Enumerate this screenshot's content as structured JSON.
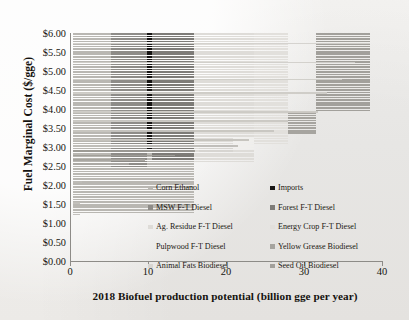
{
  "chart_data": {
    "type": "bar",
    "orientation": "horizontal-supply-curve",
    "title": "",
    "xlabel": "2018 Biofuel production potential (billion gge per year)",
    "ylabel": "Fuel Marginal Cost ($/gge)",
    "xlim": [
      0,
      40
    ],
    "ylim": [
      0,
      6
    ],
    "xticks": [
      "0",
      "10",
      "20",
      "30",
      "40"
    ],
    "xtick_values": [
      0,
      10,
      20,
      30,
      40
    ],
    "yticks": [
      "$0.00",
      "$0.50",
      "$1.00",
      "$1.50",
      "$2.00",
      "$2.50",
      "$3.00",
      "$3.50",
      "$4.00",
      "$4.50",
      "$5.00",
      "$5.50",
      "$6.00"
    ],
    "ytick_values": [
      0,
      0.5,
      1,
      1.5,
      2,
      2.5,
      3,
      3.5,
      4,
      4.5,
      5,
      5.5,
      6
    ],
    "grid": false,
    "legend_position": "inside-lower-center",
    "series": [
      {
        "name": "Corn Ethanol",
        "color": "#b9b7b2",
        "x_start": 0.35,
        "x_end": 15.9,
        "cost_low": 1.25,
        "cost_high": 6.0
      },
      {
        "name": "Imports",
        "color": "#171514",
        "x_start": 9.9,
        "x_end": 10.5,
        "cost_low": 2.95,
        "cost_high": 6.0
      },
      {
        "name": "MSW F-T Diesel",
        "color": "#8e8c88",
        "x_start": 5.2,
        "x_end": 9.9,
        "cost_low": 2.45,
        "cost_high": 6.0
      },
      {
        "name": "Forest F-T Diesel",
        "color": "#7e7c78",
        "x_start": 10.5,
        "x_end": 15.9,
        "cost_low": 2.7,
        "cost_high": 6.0
      },
      {
        "name": "Ag. Residue F-T Diesel",
        "color": "#dedcd8",
        "x_start": 15.9,
        "x_end": 23.6,
        "cost_low": 2.6,
        "cost_high": 6.0
      },
      {
        "name": "Energy Crop F-T Diesel",
        "color": "#e2e0dc",
        "x_start": 23.6,
        "x_end": 27.9,
        "cost_low": 3.05,
        "cost_high": 6.0
      },
      {
        "name": "Pulpwood F-T Diesel",
        "color": "#f0efec",
        "x_start": 20.9,
        "x_end": 23.6,
        "cost_low": 2.95,
        "cost_high": 3.25
      },
      {
        "name": "Yellow Grease Biodiesel",
        "color": "#a6a49f",
        "x_start": 27.9,
        "x_end": 31.6,
        "cost_low": 3.35,
        "cost_high": 3.95
      },
      {
        "name": "Animal Fats Biodiesel",
        "color": "#d7d5d1",
        "x_start": 16.6,
        "x_end": 20.9,
        "cost_low": 2.85,
        "cost_high": 3.05
      },
      {
        "name": "Seed Oil Biodiesel",
        "color": "#a2a09b",
        "x_start": 31.6,
        "x_end": 38.4,
        "cost_low": 3.95,
        "cost_high": 6.0
      }
    ],
    "steps": [
      {
        "x0": 0.35,
        "x1": 1.25,
        "y": 1.25,
        "color": "#c0beb9"
      },
      {
        "x0": 0.35,
        "x1": 1.3,
        "y": 1.55,
        "color": "#c0beb9"
      },
      {
        "x0": 0.35,
        "x1": 1.45,
        "y": 1.85,
        "color": "#bdbbb6"
      },
      {
        "x0": 0.35,
        "x1": 1.6,
        "y": 2.1,
        "color": "#bdbbb6"
      },
      {
        "x0": 0.35,
        "x1": 2.1,
        "y": 2.3,
        "color": "#bab8b3"
      },
      {
        "x0": 0.35,
        "x1": 4.3,
        "y": 2.45,
        "color": "#b7b5b0"
      },
      {
        "x0": 0.35,
        "x1": 7.6,
        "y": 2.58,
        "color": "#aaa8a3"
      },
      {
        "x0": 0.35,
        "x1": 9.6,
        "y": 2.68,
        "color": "#a4a29d"
      },
      {
        "x0": 0.35,
        "x1": 13.5,
        "y": 2.8,
        "color": "#a09e99"
      },
      {
        "x0": 0.35,
        "x1": 16.0,
        "y": 2.92,
        "color": "#9b9994"
      },
      {
        "x0": 0.35,
        "x1": 21.6,
        "y": 3.05,
        "color": "#bfbdb8"
      },
      {
        "x0": 0.35,
        "x1": 23.0,
        "y": 3.2,
        "color": "#c4c2bd"
      },
      {
        "x0": 0.35,
        "x1": 26.2,
        "y": 3.45,
        "color": "#c7c5c0"
      },
      {
        "x0": 0.35,
        "x1": 28.0,
        "y": 3.7,
        "color": "#c9c7c2"
      },
      {
        "x0": 0.35,
        "x1": 31.8,
        "y": 3.95,
        "color": "#cbc9c4"
      },
      {
        "x0": 0.35,
        "x1": 33.0,
        "y": 4.45,
        "color": "#cdcbc6"
      },
      {
        "x0": 0.35,
        "x1": 34.9,
        "y": 4.8,
        "color": "#cfcdc8"
      },
      {
        "x0": 0.35,
        "x1": 36.5,
        "y": 5.25,
        "color": "#d1cfca"
      },
      {
        "x0": 0.35,
        "x1": 38.4,
        "y": 5.75,
        "color": "#d3d1cc"
      }
    ]
  },
  "axis": {
    "y_title": "Fuel Marginal Cost ($/gge)",
    "x_title": "2018 Biofuel production potential (billion gge per year)"
  },
  "legend": {
    "items": [
      {
        "label": "Corn Ethanol",
        "color": "#b9b7b2",
        "swatch": true
      },
      {
        "label": "Imports",
        "color": "#171514",
        "swatch": true
      },
      {
        "label": "MSW F-T Diesel",
        "color": "#8e8c88",
        "swatch": true
      },
      {
        "label": "Forest F-T Diesel",
        "color": "#7e7c78",
        "swatch": true
      },
      {
        "label": "Ag. Residue F-T Diesel",
        "color": "#dedcd8",
        "swatch": true
      },
      {
        "label": "Energy Crop F-T Diesel",
        "color": "#e2e0dc",
        "swatch": true
      },
      {
        "label": "Pulpwood F-T Diesel",
        "color": "#f0efec",
        "swatch": false
      },
      {
        "label": "Yellow Grease Biodiesel",
        "color": "#a6a49f",
        "swatch": true
      },
      {
        "label": "Animal Fats Biodiesel",
        "color": "#d7d5d1",
        "swatch": true
      },
      {
        "label": "Seed Oil Biodiesel",
        "color": "#a2a09b",
        "swatch": true
      }
    ]
  }
}
